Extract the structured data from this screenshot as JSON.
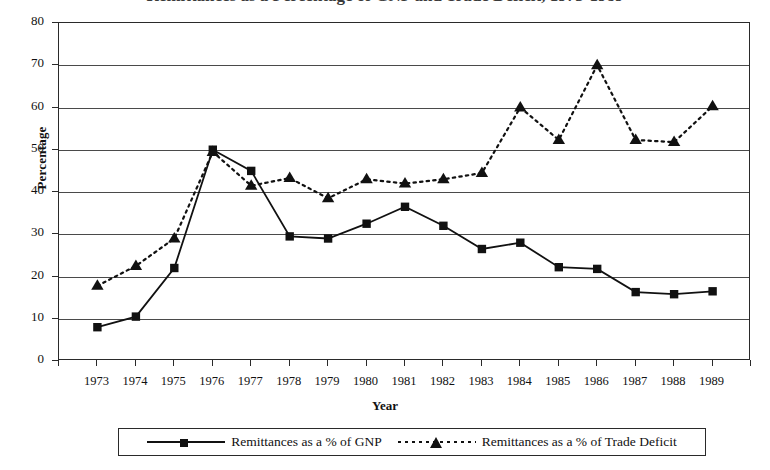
{
  "title_cropped": "Remittances as a Percentage of GNP and Trade Deficit, 1973-1989",
  "axes": {
    "ylabel": "Percentage",
    "xlabel": "Year",
    "ytick_labels": [
      "80",
      "70",
      "60",
      "50",
      "40",
      "30",
      "20",
      "10",
      "0"
    ],
    "xtick_labels": [
      "1973",
      "1974",
      "1975",
      "1976",
      "1977",
      "1978",
      "1979",
      "1980",
      "1981",
      "1982",
      "1983",
      "1984",
      "1985",
      "1986",
      "1987",
      "1988",
      "1989"
    ]
  },
  "legend": {
    "items": [
      {
        "label": "Remittances as a % of GNP",
        "marker": "square-marker",
        "line": "solid"
      },
      {
        "label": "Remittances as a % of Trade Deficit",
        "marker": "triangle-marker",
        "line": "dotted"
      }
    ]
  },
  "colors": {
    "series": "#111111",
    "grid": "#4a4a4a",
    "frame": "#2a2a2a",
    "background": "#ffffff"
  },
  "chart_data": {
    "type": "line",
    "title": "Remittances as a Percentage of GNP and Trade Deficit, 1973-1989",
    "xlabel": "Year",
    "ylabel": "Percentage",
    "ylim": [
      0,
      80
    ],
    "ytick_step": 10,
    "grid": true,
    "legend_position": "bottom",
    "categories": [
      "1973",
      "1974",
      "1975",
      "1976",
      "1977",
      "1978",
      "1979",
      "1980",
      "1981",
      "1982",
      "1983",
      "1984",
      "1985",
      "1986",
      "1987",
      "1988",
      "1989"
    ],
    "series": [
      {
        "name": "Remittances as a % of GNP",
        "marker": "square",
        "linestyle": "solid",
        "values": [
          8.0,
          10.5,
          22.0,
          50.0,
          45.0,
          29.5,
          29.0,
          32.5,
          36.5,
          32.0,
          26.5,
          28.0,
          22.2,
          21.8,
          16.3,
          15.8,
          16.5
        ]
      },
      {
        "name": "Remittances as a % of Trade Deficit",
        "marker": "triangle",
        "linestyle": "dotted",
        "values": [
          17.8,
          22.5,
          29.0,
          49.5,
          41.5,
          43.3,
          38.5,
          43.0,
          42.0,
          43.0,
          44.5,
          60.0,
          52.3,
          70.0,
          52.3,
          51.8,
          60.3
        ]
      }
    ]
  }
}
